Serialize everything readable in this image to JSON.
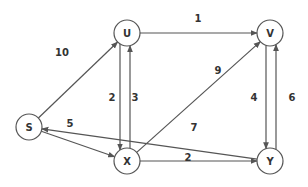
{
  "graph": {
    "type": "directed-weighted",
    "nodes": [
      {
        "id": "S",
        "label": "S"
      },
      {
        "id": "U",
        "label": "U"
      },
      {
        "id": "V",
        "label": "V"
      },
      {
        "id": "X",
        "label": "X"
      },
      {
        "id": "Y",
        "label": "Y"
      }
    ],
    "edges": [
      {
        "from": "S",
        "to": "U",
        "weight": "10"
      },
      {
        "from": "S",
        "to": "X",
        "weight": "5"
      },
      {
        "from": "U",
        "to": "V",
        "weight": "1"
      },
      {
        "from": "U",
        "to": "X",
        "weight": "2"
      },
      {
        "from": "X",
        "to": "U",
        "weight": "3"
      },
      {
        "from": "X",
        "to": "V",
        "weight": "9"
      },
      {
        "from": "V",
        "to": "Y",
        "weight": "4"
      },
      {
        "from": "Y",
        "to": "V",
        "weight": "6"
      },
      {
        "from": "X",
        "to": "Y",
        "weight": "2"
      },
      {
        "from": "Y",
        "to": "S",
        "weight": "7"
      }
    ],
    "colors": {
      "stroke": "#555555",
      "text": "#333333",
      "background": "#ffffff"
    }
  }
}
